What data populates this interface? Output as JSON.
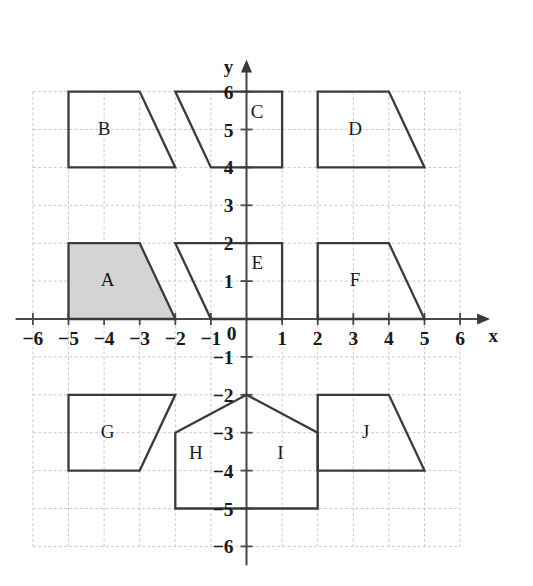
{
  "chart_data": {
    "type": "scatter",
    "title": "",
    "xlabel": "x",
    "ylabel": "y",
    "xlim": [
      -6.6,
      6.9
    ],
    "ylim": [
      -6.6,
      6.9
    ],
    "grid": true,
    "legend": "none",
    "x_ticks": [
      "-6",
      "-5",
      "-4",
      "-3",
      "-2",
      "-1",
      "1",
      "2",
      "3",
      "4",
      "5",
      "6"
    ],
    "y_ticks": [
      "6",
      "5",
      "4",
      "3",
      "2",
      "1",
      "-1",
      "-2",
      "-3",
      "-4",
      "-5",
      "-6"
    ],
    "origin_label": "0",
    "grid_extent": {
      "x_min": -6,
      "x_max": 6,
      "y_min": -6,
      "y_max": 6
    },
    "shapes": [
      {
        "label": "A",
        "shape_type": "trapezoid",
        "filled": true,
        "fill_color": "#d4d4d4",
        "stroke_color": "#3a3a3a",
        "label_point": [
          -3.9,
          1.0
        ],
        "points": [
          [
            -5,
            0
          ],
          [
            -5,
            2
          ],
          [
            -3,
            2
          ],
          [
            -2,
            0
          ]
        ]
      },
      {
        "label": "B",
        "shape_type": "trapezoid",
        "filled": false,
        "fill_color": "none",
        "stroke_color": "#3a3a3a",
        "label_point": [
          -4.0,
          5.0
        ],
        "points": [
          [
            -5,
            4
          ],
          [
            -5,
            6
          ],
          [
            -3,
            6
          ],
          [
            -2,
            4
          ]
        ]
      },
      {
        "label": "C",
        "shape_type": "trapezoid",
        "filled": false,
        "fill_color": "none",
        "stroke_color": "#3a3a3a",
        "label_point": [
          0.3,
          5.45
        ],
        "points": [
          [
            -2,
            6
          ],
          [
            1,
            6
          ],
          [
            1,
            4
          ],
          [
            -1,
            4
          ]
        ]
      },
      {
        "label": "D",
        "shape_type": "trapezoid",
        "filled": false,
        "fill_color": "none",
        "stroke_color": "#3a3a3a",
        "label_point": [
          3.05,
          5.0
        ],
        "points": [
          [
            2,
            4
          ],
          [
            2,
            6
          ],
          [
            4,
            6
          ],
          [
            5,
            4
          ]
        ]
      },
      {
        "label": "E",
        "shape_type": "trapezoid",
        "filled": false,
        "fill_color": "none",
        "stroke_color": "#3a3a3a",
        "label_point": [
          0.3,
          1.45
        ],
        "points": [
          [
            -2,
            2
          ],
          [
            1,
            2
          ],
          [
            1,
            0
          ],
          [
            -1,
            0
          ]
        ]
      },
      {
        "label": "F",
        "shape_type": "trapezoid",
        "filled": false,
        "fill_color": "none",
        "stroke_color": "#3a3a3a",
        "label_point": [
          3.05,
          1.0
        ],
        "points": [
          [
            2,
            0
          ],
          [
            2,
            2
          ],
          [
            4,
            2
          ],
          [
            5,
            0
          ]
        ]
      },
      {
        "label": "G",
        "shape_type": "trapezoid",
        "filled": false,
        "fill_color": "none",
        "stroke_color": "#3a3a3a",
        "label_point": [
          -3.9,
          -3.0
        ],
        "points": [
          [
            -5,
            -2
          ],
          [
            -2,
            -2
          ],
          [
            -3,
            -4
          ],
          [
            -5,
            -4
          ]
        ]
      },
      {
        "label": "HI",
        "shape_type": "pentagon",
        "filled": false,
        "fill_color": "none",
        "stroke_color": "#3a3a3a",
        "label_point": null,
        "points": [
          [
            -2,
            -3
          ],
          [
            0,
            -2
          ],
          [
            2,
            -3
          ],
          [
            2,
            -5
          ],
          [
            -2,
            -5
          ]
        ]
      },
      {
        "label": "J",
        "shape_type": "trapezoid",
        "filled": false,
        "fill_color": "none",
        "stroke_color": "#3a3a3a",
        "label_point": [
          3.35,
          -3.0
        ],
        "points": [
          [
            2,
            -2
          ],
          [
            4,
            -2
          ],
          [
            5,
            -4
          ],
          [
            2,
            -4
          ]
        ]
      }
    ],
    "extra_labels": [
      {
        "label": "H",
        "label_point": [
          -1.42,
          -3.55
        ]
      },
      {
        "label": "I",
        "label_point": [
          0.95,
          -3.55
        ]
      }
    ]
  }
}
